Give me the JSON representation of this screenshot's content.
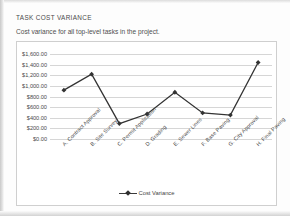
{
  "report": {
    "title": "TASK COST VARIANCE",
    "subtitle": "Cost variance for all top-level tasks in the project."
  },
  "chart_data": {
    "type": "line",
    "title": "TASK COST VARIANCE",
    "subtitle": "Cost variance for all top-level tasks in the project.",
    "xlabel": "",
    "ylabel": "",
    "categories": [
      "A. Contract Approval",
      "B. Site Survey",
      "C. Permit Application",
      "D. Grading",
      "E. Sewer Lines",
      "F. Base Paving",
      "G. City Approval",
      "H. Final Paving"
    ],
    "series": [
      {
        "name": "Cost Variance",
        "values": [
          920,
          1220,
          290,
          470,
          880,
          490,
          450,
          1440
        ],
        "color": "#333333",
        "marker": "diamond"
      }
    ],
    "ylim": [
      0,
      1600
    ],
    "yticks": [
      0,
      200,
      400,
      600,
      800,
      1000,
      1200,
      1400,
      1600
    ],
    "ytick_labels": [
      "$0.00",
      "$200.00",
      "$400.00",
      "$600.00",
      "$800.00",
      "$1,000.00",
      "$1,200.00",
      "$1,400.00",
      "$1,600.00"
    ],
    "grid": true,
    "legend": {
      "position": "bottom",
      "entries": [
        "Cost Variance"
      ]
    }
  }
}
